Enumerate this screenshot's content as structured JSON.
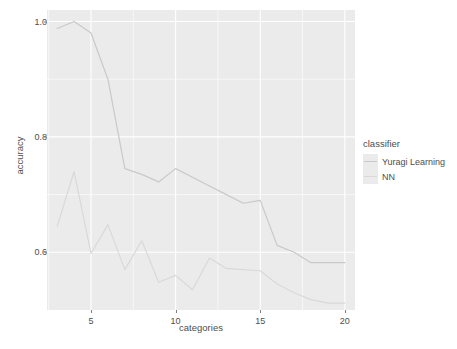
{
  "chart_data": {
    "type": "line",
    "title": "",
    "xlabel": "categories",
    "ylabel": "accuracy",
    "xlim": [
      2.4,
      20.6
    ],
    "ylim": [
      0.5,
      1.02
    ],
    "grid": true,
    "legend_position": "right",
    "legend_title": "classifier",
    "x_ticks": [
      5,
      10,
      15,
      20
    ],
    "x_tick_labels": [
      "5",
      "10",
      "15",
      "20"
    ],
    "y_ticks": [
      0.6,
      0.8,
      1.0
    ],
    "y_tick_labels": [
      "0.6",
      "0.8",
      "1.0"
    ],
    "x": [
      3,
      4,
      5,
      6,
      7,
      8,
      9,
      10,
      11,
      12,
      13,
      14,
      15,
      16,
      17,
      18,
      19,
      20
    ],
    "series": [
      {
        "name": "Yuragi Learning",
        "color": "#c9c9c9",
        "values": [
          0.988,
          1.0,
          0.98,
          0.9,
          0.745,
          0.735,
          0.722,
          0.745,
          0.73,
          0.715,
          0.7,
          0.685,
          0.69,
          0.612,
          0.6,
          0.582,
          0.582,
          0.582
        ]
      },
      {
        "name": "NN",
        "color": "#d9d9d9",
        "values": [
          0.645,
          0.74,
          0.598,
          0.648,
          0.57,
          0.62,
          0.548,
          0.56,
          0.535,
          0.59,
          0.572,
          0.57,
          0.568,
          0.545,
          0.53,
          0.518,
          0.512,
          0.512
        ]
      }
    ]
  },
  "theme": {
    "panel_background": "#ebebeb",
    "grid_color": "#ffffff",
    "text_color": "#4d4d4d",
    "plot_background": "#ffffff"
  }
}
